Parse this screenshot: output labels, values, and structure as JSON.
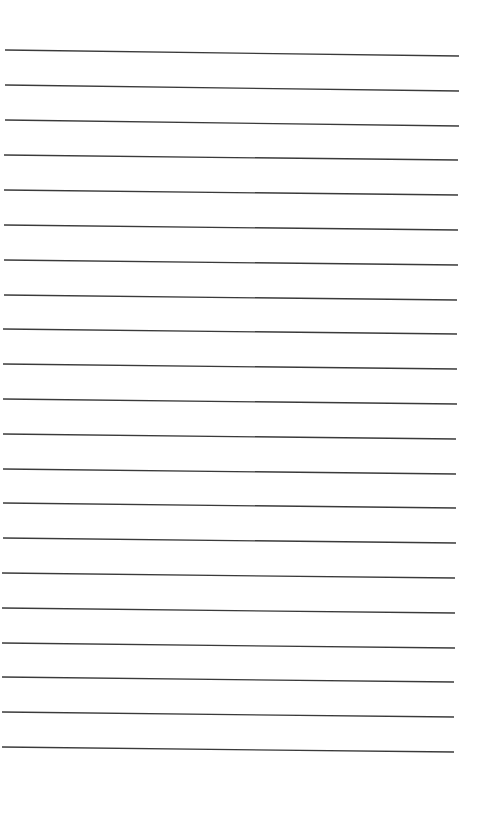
{
  "page": {
    "type": "lined-paper",
    "background_color": "#ffffff",
    "line_color": "#3a3a3a",
    "line_count": 21,
    "lines": [
      {
        "x1": 5,
        "y1": 50,
        "x2": 459,
        "y2": 56
      },
      {
        "x1": 5,
        "y1": 85,
        "x2": 459,
        "y2": 91
      },
      {
        "x1": 5,
        "y1": 120,
        "x2": 459,
        "y2": 126
      },
      {
        "x1": 4,
        "y1": 155,
        "x2": 458,
        "y2": 160
      },
      {
        "x1": 4,
        "y1": 190,
        "x2": 458,
        "y2": 195
      },
      {
        "x1": 4,
        "y1": 225,
        "x2": 458,
        "y2": 230
      },
      {
        "x1": 4,
        "y1": 260,
        "x2": 458,
        "y2": 265
      },
      {
        "x1": 4,
        "y1": 295,
        "x2": 457,
        "y2": 300
      },
      {
        "x1": 3,
        "y1": 329,
        "x2": 457,
        "y2": 334
      },
      {
        "x1": 3,
        "y1": 364,
        "x2": 457,
        "y2": 369
      },
      {
        "x1": 3,
        "y1": 399,
        "x2": 457,
        "y2": 404
      },
      {
        "x1": 3,
        "y1": 434,
        "x2": 456,
        "y2": 439
      },
      {
        "x1": 3,
        "y1": 469,
        "x2": 456,
        "y2": 474
      },
      {
        "x1": 3,
        "y1": 503,
        "x2": 456,
        "y2": 508
      },
      {
        "x1": 3,
        "y1": 538,
        "x2": 456,
        "y2": 543
      },
      {
        "x1": 2,
        "y1": 573,
        "x2": 455,
        "y2": 578
      },
      {
        "x1": 2,
        "y1": 608,
        "x2": 455,
        "y2": 613
      },
      {
        "x1": 2,
        "y1": 643,
        "x2": 455,
        "y2": 648
      },
      {
        "x1": 2,
        "y1": 677,
        "x2": 454,
        "y2": 682
      },
      {
        "x1": 2,
        "y1": 712,
        "x2": 454,
        "y2": 717
      },
      {
        "x1": 2,
        "y1": 747,
        "x2": 454,
        "y2": 752
      }
    ]
  }
}
